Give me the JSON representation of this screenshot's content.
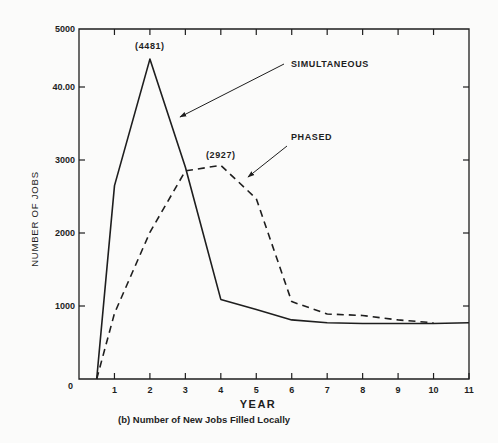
{
  "chart_data": {
    "type": "line",
    "title": "",
    "caption": "(b) Number of New Jobs Filled Locally",
    "xlabel": "YEAR",
    "ylabel": "NUMBER OF JOBS",
    "xlim": [
      0,
      11
    ],
    "ylim": [
      0,
      5000
    ],
    "x_ticks": [
      1,
      2,
      3,
      4,
      5,
      6,
      7,
      8,
      9,
      10,
      11
    ],
    "x_tick_labels": [
      "1",
      "2",
      "3",
      "4",
      "5",
      "6",
      "7",
      "8",
      "9",
      "10",
      "11"
    ],
    "y_ticks": [
      0,
      1000,
      2000,
      3000,
      4000,
      5000
    ],
    "y_tick_labels": [
      "0",
      "1000",
      "2000",
      "3000",
      "40.00",
      "5000"
    ],
    "grid": false,
    "legend": "annotations with arrows (top-right)",
    "series": [
      {
        "name": "SIMULTANEOUS",
        "style": "solid",
        "x": [
          0.5,
          1,
          2,
          3,
          4,
          5,
          6,
          7,
          8,
          9,
          10,
          11
        ],
        "values": [
          0,
          2650,
          4481,
          2900,
          1090,
          950,
          810,
          770,
          760,
          760,
          760,
          770
        ]
      },
      {
        "name": "PHASED",
        "style": "dashed",
        "x": [
          0.5,
          1,
          2,
          3,
          4,
          5,
          6,
          7,
          8,
          9,
          10
        ],
        "values": [
          0,
          900,
          2010,
          2850,
          2927,
          2470,
          1060,
          890,
          870,
          810,
          770
        ]
      }
    ],
    "annotations": [
      {
        "text": "(4481)",
        "series": "SIMULTANEOUS",
        "x": 2,
        "y": 4481
      },
      {
        "text": "(2927)",
        "series": "PHASED",
        "x": 4,
        "y": 2927
      }
    ],
    "legend_labels": {
      "simultaneous": "SIMULTANEOUS",
      "phased": "PHASED"
    }
  }
}
